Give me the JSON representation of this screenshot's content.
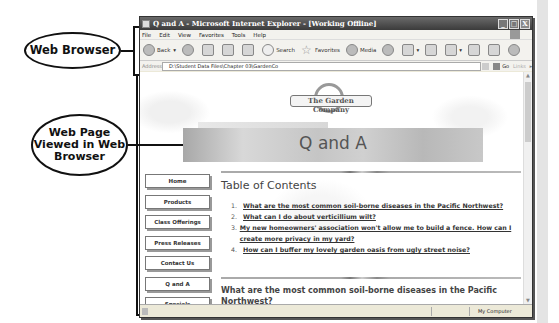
{
  "callouts": {
    "browser": "Web Browser",
    "web_page": "Web Page Viewed in Web Browser"
  },
  "window": {
    "title": "Q and A - Microsoft Internet Explorer - [Working Offline]",
    "controls": {
      "minimize": "_",
      "maximize": "□",
      "close": "X"
    }
  },
  "menu": [
    "File",
    "Edit",
    "View",
    "Favorites",
    "Tools",
    "Help"
  ],
  "toolbar": {
    "back": "Back",
    "search": "Search",
    "favorites": "Favorites",
    "media": "Media"
  },
  "address": {
    "label": "Address",
    "value": "D:\\Student Data Files\\Chapter 03\\GardenCo",
    "go": "Go",
    "links": "Links"
  },
  "page": {
    "logo_text": "The Garden Company",
    "banner_title": "Q and A",
    "nav": [
      "Home",
      "Products",
      "Class Offerings",
      "Press Releases",
      "Contact Us",
      "Q and A",
      "Specials"
    ],
    "toc_title": "Table of Contents",
    "toc": [
      {
        "num": "1.",
        "text": "What are the most common soil-borne diseases in the Pacific Northwest?"
      },
      {
        "num": "2.",
        "text": "What can I do about verticillium wilt?"
      },
      {
        "num": "3.",
        "text": "My new homeowners' association won't allow me to build a fence. How can I create more privacy in my yard?"
      },
      {
        "num": "4.",
        "text": "How can I buffer my lovely garden oasis from ugly street noise?"
      }
    ],
    "question_heading": "What are the most common soil-borne diseases in the Pacific Northwest?"
  },
  "status": {
    "zone": "My Computer"
  }
}
